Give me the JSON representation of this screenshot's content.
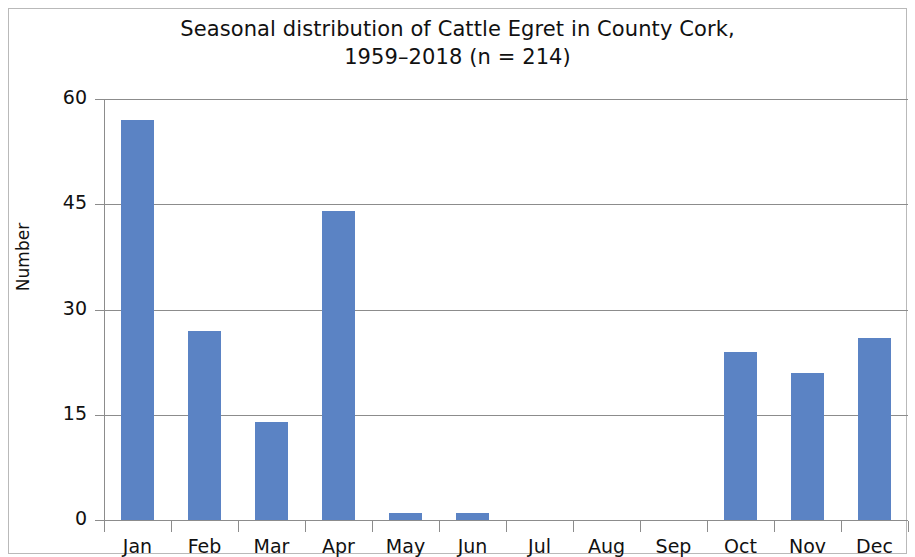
{
  "chart_data": {
    "type": "bar",
    "title": "Seasonal distribution of Cattle Egret in County Cork,\n1959–2018 (n = 214)",
    "title_line1": "Seasonal distribution of Cattle Egret in County Cork,",
    "title_line2": "1959–2018 (n = 214)",
    "xlabel": "",
    "ylabel": "Number",
    "categories": [
      "Jan",
      "Feb",
      "Mar",
      "Apr",
      "May",
      "Jun",
      "Jul",
      "Aug",
      "Sep",
      "Oct",
      "Nov",
      "Dec"
    ],
    "values": [
      57,
      27,
      14,
      44,
      1,
      1,
      0,
      0,
      0,
      24,
      21,
      26
    ],
    "ylim": [
      0,
      60
    ],
    "yticks": [
      0,
      15,
      30,
      45,
      60
    ],
    "ytick_labels": [
      "0",
      "15",
      "30",
      "45",
      "60"
    ],
    "grid": true,
    "grid_axis": "y",
    "legend": false,
    "bar_color": "#5B83C4",
    "axis_color": "#8c8c8c",
    "background": "#ffffff",
    "border_color": "#b9b9b9",
    "n_total": 214,
    "period": "1959–2018"
  }
}
